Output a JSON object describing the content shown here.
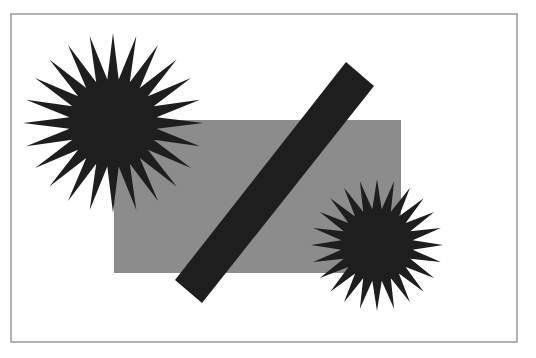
{
  "figure": {
    "frame": {
      "x": 11,
      "y": 14,
      "width": 506,
      "height": 328,
      "stroke": "#9a9a9a"
    },
    "colors": {
      "background": "#ffffff",
      "rectangle": "#8c8c8c",
      "dark": "#1e1e1e"
    },
    "rectangle": {
      "x": 114,
      "y": 120,
      "width": 287,
      "height": 153
    },
    "bar": {
      "points": [
        [
          346,
          62
        ],
        [
          374,
          86
        ],
        [
          202,
          303
        ],
        [
          175,
          280
        ]
      ]
    },
    "stars": [
      {
        "name": "large-starburst",
        "cx": 113,
        "cy": 123,
        "outer": 90,
        "inner": 44,
        "points": 24
      },
      {
        "name": "small-starburst",
        "cx": 377,
        "cy": 245,
        "outer": 66,
        "inner": 36,
        "points": 24
      }
    ]
  }
}
